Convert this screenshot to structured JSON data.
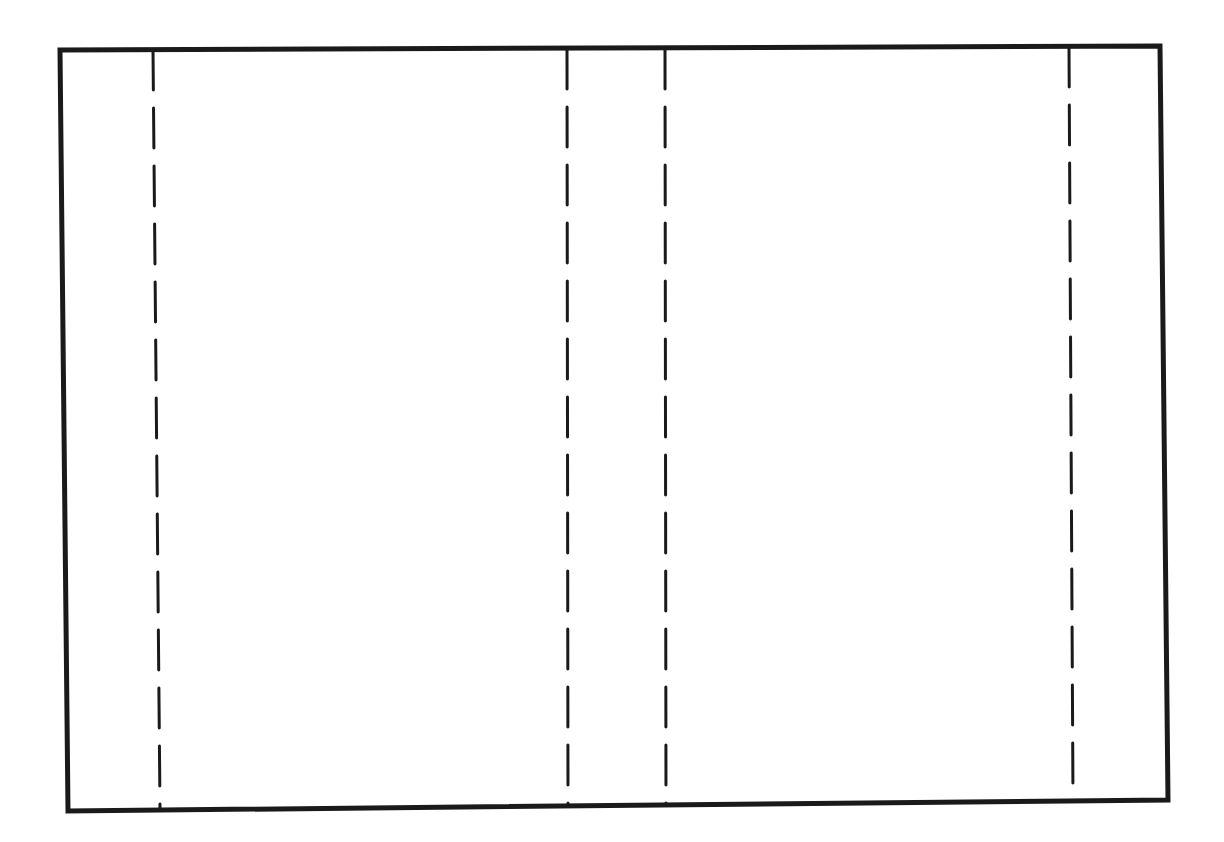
{
  "diagram": {
    "type": "panel-layout",
    "frame_label": "",
    "fold_lines": [
      {
        "id": "fold-1",
        "style": "dashed",
        "orientation": "vertical"
      },
      {
        "id": "fold-2",
        "style": "dashed",
        "orientation": "vertical"
      },
      {
        "id": "fold-3",
        "style": "dashed",
        "orientation": "vertical"
      },
      {
        "id": "fold-4",
        "style": "dashed",
        "orientation": "vertical"
      }
    ],
    "colors": {
      "line": "#1a1a1a",
      "background": "#ffffff"
    }
  }
}
